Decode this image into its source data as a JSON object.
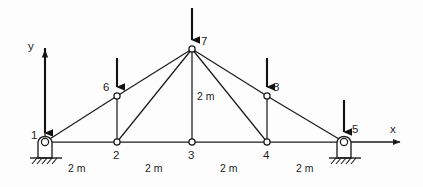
{
  "figure": {
    "type": "truss-free-body-diagram",
    "background_color": "#fdfdfd",
    "line_color": "#1d1d1d",
    "load_arrow_color": "#111111"
  },
  "axes": {
    "x_label": "x",
    "y_label": "y",
    "origin_node": "1"
  },
  "nodes": [
    {
      "id": "1",
      "label": "1",
      "x": 0,
      "y": 0,
      "px": 45,
      "py": 142,
      "type": "pin-support",
      "label_pos": "left"
    },
    {
      "id": "2",
      "label": "2",
      "x": 2,
      "y": 0,
      "px": 117,
      "py": 142,
      "type": "joint",
      "label_pos": "below"
    },
    {
      "id": "3",
      "label": "3",
      "x": 4,
      "y": 0,
      "px": 192,
      "py": 142,
      "type": "joint",
      "label_pos": "below"
    },
    {
      "id": "4",
      "label": "4",
      "x": 6,
      "y": 0,
      "px": 267,
      "py": 142,
      "type": "joint",
      "label_pos": "below"
    },
    {
      "id": "5",
      "label": "5",
      "x": 8,
      "y": 0,
      "px": 344,
      "py": 142,
      "type": "pin-support",
      "label_pos": "right"
    },
    {
      "id": "6",
      "label": "6",
      "x": 2,
      "y": 1,
      "px": 117,
      "py": 96,
      "type": "joint",
      "label_pos": "left"
    },
    {
      "id": "7",
      "label": "7",
      "x": 4,
      "y": 2,
      "px": 192,
      "py": 49,
      "type": "joint",
      "label_pos": "right"
    },
    {
      "id": "8",
      "label": "8",
      "x": 6,
      "y": 1,
      "px": 267,
      "py": 96,
      "type": "joint",
      "label_pos": "right"
    }
  ],
  "members": [
    {
      "from": "1",
      "to": "2"
    },
    {
      "from": "2",
      "to": "3"
    },
    {
      "from": "3",
      "to": "4"
    },
    {
      "from": "4",
      "to": "5"
    },
    {
      "from": "1",
      "to": "6"
    },
    {
      "from": "6",
      "to": "7"
    },
    {
      "from": "7",
      "to": "8"
    },
    {
      "from": "8",
      "to": "5"
    },
    {
      "from": "6",
      "to": "2"
    },
    {
      "from": "8",
      "to": "4"
    },
    {
      "from": "7",
      "to": "2"
    },
    {
      "from": "7",
      "to": "3"
    },
    {
      "from": "7",
      "to": "4"
    }
  ],
  "loads": [
    {
      "at_node": "1",
      "direction": "down"
    },
    {
      "at_node": "6",
      "direction": "down"
    },
    {
      "at_node": "7",
      "direction": "down"
    },
    {
      "at_node": "8",
      "direction": "down"
    },
    {
      "at_node": "5",
      "direction": "down"
    }
  ],
  "dimensions": {
    "horizontal": [
      {
        "label": "2 m",
        "span": "1-2"
      },
      {
        "label": "2 m",
        "span": "2-3"
      },
      {
        "label": "2 m",
        "span": "3-4"
      },
      {
        "label": "2 m",
        "span": "4-5"
      }
    ],
    "vertical": [
      {
        "label": "2 m",
        "span": "3-7"
      }
    ]
  }
}
